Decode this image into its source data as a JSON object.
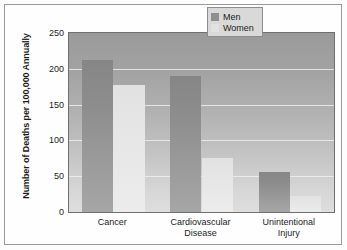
{
  "chart_data": {
    "type": "bar",
    "title": "",
    "subtitle": "",
    "xlabel": "",
    "ylabel": "Number of Deaths per 100,000 Annually",
    "categories": [
      "Cancer",
      "Cardiovascular Disease",
      "Unintentional Injury"
    ],
    "category_lines": [
      [
        "Cancer"
      ],
      [
        "Cardiovascular",
        "Disease"
      ],
      [
        "Unintentional",
        "Injury"
      ]
    ],
    "series": [
      {
        "name": "Men",
        "color": "#8f8f8f",
        "values": [
          212,
          190,
          56
        ]
      },
      {
        "name": "Women",
        "color": "#e2e2e2",
        "values": [
          178,
          76,
          23
        ]
      }
    ],
    "ylim": [
      0,
      250
    ],
    "yticks": [
      0,
      50,
      100,
      150,
      200,
      250
    ],
    "ytick_labels": [
      "0",
      "50",
      "100",
      "150",
      "200",
      "250"
    ],
    "grid": true,
    "grid_axis": "y",
    "legend_position": "top-right",
    "legend_entries": [
      "Men",
      "Women"
    ]
  },
  "legend": {
    "items": [
      {
        "label": "Men",
        "swatch": "legend-swatch-men"
      },
      {
        "label": "Women",
        "swatch": "legend-swatch-women"
      }
    ]
  },
  "axes": {
    "y_title": "Number of Deaths per 100,000 Annually"
  },
  "colors": {
    "men_bar": "#8f8f8f",
    "women_bar": "#e2e2e2",
    "gridline": "#efefef",
    "plot_border": "#6f6f6f",
    "frame_border": "#9a9a9a",
    "text": "#1b1b1b"
  }
}
